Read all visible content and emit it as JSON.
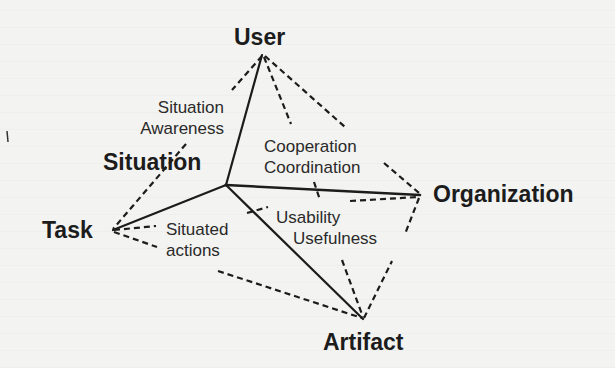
{
  "diagram": {
    "nodes": {
      "user": "User",
      "situation": "Situation",
      "task": "Task",
      "organization": "Organization",
      "artifact": "Artifact"
    },
    "relations": {
      "situation_awareness": [
        "Situation",
        "Awareness"
      ],
      "cooperation_coordination": [
        "Cooperation",
        "Coordination"
      ],
      "situated_actions": [
        "Situated",
        "actions"
      ],
      "usability_usefulness": [
        "Usability",
        "Usefulness"
      ]
    },
    "colors": {
      "background": "#f3f3f1",
      "ink": "#1c1c1c"
    }
  }
}
